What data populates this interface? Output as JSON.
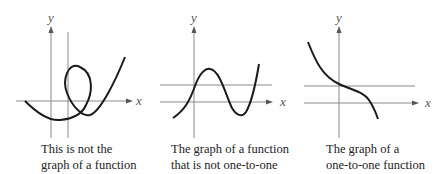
{
  "panels": [
    {
      "id": "not-a-function",
      "x_label": "x",
      "y_label": "y",
      "caption_line1": "This is not the",
      "caption_line2": "graph of a function",
      "test_line": "vertical"
    },
    {
      "id": "function-not-one-to-one",
      "x_label": "x",
      "y_label": "y",
      "caption_line1": "The graph of a function",
      "caption_line2": "that is not one-to-one",
      "test_line": "horizontal"
    },
    {
      "id": "one-to-one-function",
      "x_label": "x",
      "y_label": "y",
      "caption_line1": "The graph of a",
      "caption_line2": "one-to-one function",
      "test_line": "horizontal"
    }
  ],
  "colors": {
    "curve": "#1a1a1a",
    "axes": "#8a8a8a",
    "text": "#222222"
  }
}
